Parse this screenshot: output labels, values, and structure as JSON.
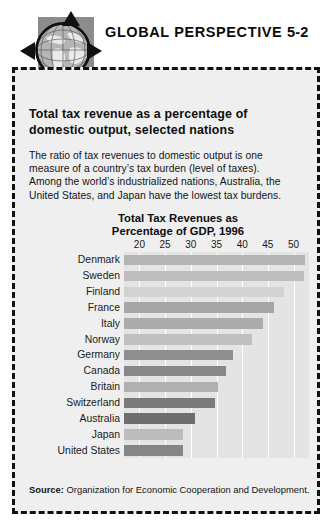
{
  "header": {
    "title": "GLOBAL PERSPECTIVE",
    "number": "5-2",
    "logo_icon": "globe-icon",
    "arrow_up_icon": "arrow-up-icon",
    "arrow_down_icon": "arrow-down-icon",
    "arrow_left_icon": "arrow-left-icon",
    "arrow_right_icon": "arrow-right-icon"
  },
  "subtitle": {
    "line1": "Total tax revenue as a percentage of",
    "line2": "domestic output, selected nations"
  },
  "body": {
    "line1": "The ratio of tax revenues to domestic output is one",
    "line2": "measure of a country’s tax burden (level of taxes).",
    "line3": "Among the world’s industrialized nations, Australia, the",
    "line4": "United States, and Japan have the lowest tax burdens."
  },
  "source": {
    "label": "Source:",
    "text": "Organization for Economic Cooperation and Development."
  },
  "chart_data": {
    "type": "bar",
    "orientation": "horizontal",
    "title": "Total Tax Revenues as Percentage of GDP, 1996",
    "title_line1": "Total Tax Revenues as",
    "title_line2": "Percentage of GDP, 1996",
    "xlabel": "",
    "ylabel": "",
    "xlim": [
      17,
      53
    ],
    "xticks": [
      20,
      25,
      30,
      35,
      40,
      45,
      50
    ],
    "xtick_labels": [
      "20",
      "25",
      "30",
      "35",
      "40",
      "45",
      "50"
    ],
    "grid": true,
    "legend": "none",
    "categories": [
      "Denmark",
      "Sweden",
      "Finland",
      "France",
      "Italy",
      "Norway",
      "Germany",
      "Canada",
      "Britain",
      "Switzerland",
      "Australia",
      "Japan",
      "United States"
    ],
    "values": [
      52.2,
      52.0,
      48.2,
      46.1,
      44.1,
      42.0,
      38.2,
      36.8,
      35.3,
      34.7,
      30.9,
      28.4,
      28.5
    ],
    "bar_colors": [
      "#b4b4b4",
      "#bdbdbd",
      "#d2d2d2",
      "#a6a6a6",
      "#ababab",
      "#c0c0c0",
      "#8f8f8f",
      "#878787",
      "#b0b0b0",
      "#7a7a7a",
      "#6e6e6e",
      "#bcbcbc",
      "#858585"
    ],
    "plot_background": "#e4e4e4",
    "gridline_color": "#ffffff"
  }
}
